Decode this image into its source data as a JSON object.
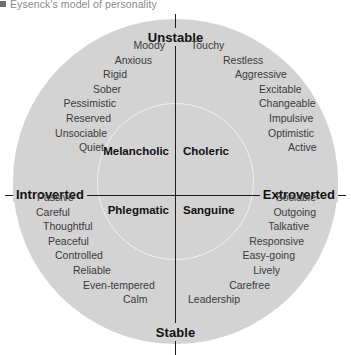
{
  "caption": {
    "bullet": "square-bullet",
    "text": "Eysenck's model of personality"
  },
  "chart_data": {
    "type": "scatter",
    "title": "Eysenck's model of personality",
    "xlabel": "Introversion – Extroversion",
    "ylabel": "Stability – Instability",
    "axes": {
      "vertical_top": "Unstable",
      "vertical_bottom": "Stable",
      "horizontal_left": "Introverted",
      "horizontal_right": "Extroverted"
    },
    "quadrants": [
      {
        "temperament": "Melancholic",
        "position": "unstable-introverted",
        "traits": [
          "Moody",
          "Anxious",
          "Rigid",
          "Sober",
          "Pessimistic",
          "Reserved",
          "Unsociable",
          "Quiet"
        ]
      },
      {
        "temperament": "Choleric",
        "position": "unstable-extroverted",
        "traits": [
          "Touchy",
          "Restless",
          "Aggressive",
          "Excitable",
          "Changeable",
          "Impulsive",
          "Optimistic",
          "Active"
        ]
      },
      {
        "temperament": "Phlegmatic",
        "position": "stable-introverted",
        "traits": [
          "Passive",
          "Careful",
          "Thoughtful",
          "Peaceful",
          "Controlled",
          "Reliable",
          "Even-tempered",
          "Calm"
        ]
      },
      {
        "temperament": "Sanguine",
        "position": "stable-extroverted",
        "traits": [
          "Sociable",
          "Outgoing",
          "Talkative",
          "Responsive",
          "Easy-going",
          "Lively",
          "Carefree",
          "Leadership"
        ]
      }
    ],
    "colors": {
      "disc_fill": "#d3d3d3",
      "inner_ring": "#f2f2f2",
      "axis": "#1d1d1d",
      "trait_text": "#3a3a3a",
      "pole_text": "#111111",
      "caption_text": "#8a8a8a",
      "background": "#ffffff"
    },
    "grid": false,
    "legend": "none"
  }
}
